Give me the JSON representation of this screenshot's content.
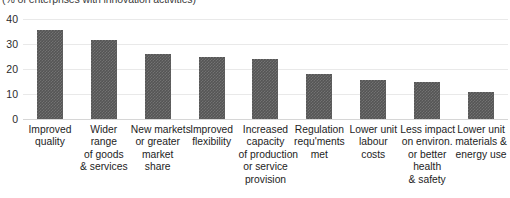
{
  "chart_data": {
    "type": "bar",
    "title": "",
    "subtitle": "(% of enterprises with innovation activities)",
    "xlabel": "",
    "ylabel": "",
    "ylim": [
      0,
      40
    ],
    "yticks": [
      0,
      10,
      20,
      30,
      40
    ],
    "grid": true,
    "legend": "none",
    "bar_color": "#555555",
    "categories": [
      "Improved quality",
      "Wider range of goods & services",
      "New markets or greater market share",
      "Improved flexibility",
      "Increased capacity of production or service provision",
      "Regulation requ'ments met",
      "Lower unit labour costs",
      "Less impact on environ. or better health & safety",
      "Lower unit materials & energy use"
    ],
    "category_lines": [
      [
        "Improved",
        "quality"
      ],
      [
        "Wider",
        "range",
        "of goods",
        "& services"
      ],
      [
        "New markets",
        "or greater",
        "market",
        "share"
      ],
      [
        "Improved",
        "flexibility"
      ],
      [
        "Increased",
        "capacity",
        "of production",
        "or service",
        "provision"
      ],
      [
        "Regulation",
        "requ'ments",
        "met"
      ],
      [
        "Lower unit",
        "labour",
        "costs"
      ],
      [
        "Less impact",
        "on environ.",
        "or better",
        "health",
        "& safety"
      ],
      [
        "Lower unit",
        "materials &",
        "energy use"
      ]
    ],
    "values": [
      35.5,
      31.5,
      26,
      25,
      24,
      18,
      15.5,
      15,
      11
    ]
  }
}
